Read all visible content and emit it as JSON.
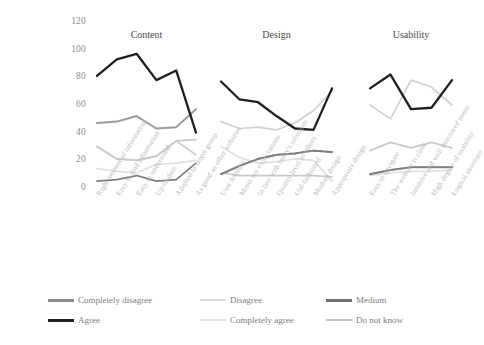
{
  "chart_data": {
    "type": "line",
    "title": "",
    "xlabel": "",
    "ylabel": "",
    "ylim": [
      0,
      120
    ],
    "ytick_values": [
      0,
      20,
      40,
      60,
      80,
      100,
      120
    ],
    "ytick_labels": [
      "0",
      "20",
      "40",
      "60",
      "80",
      "100",
      "120"
    ],
    "grid": false,
    "legend_position": "bottom",
    "panels": [
      {
        "name": "Content",
        "title": "Content",
        "categories": [
          "Right amount of information",
          "Easy to find information",
          "Easy to understand",
          "Up-to-date",
          "Adapted to target group",
          "As good as other websites"
        ],
        "series": [
          {
            "name": "Completely disagree",
            "color": "#7d7d7d",
            "values": [
              5,
              6,
              9,
              5,
              6,
              18
            ]
          },
          {
            "name": "Disagree",
            "color": "#e0e0e0",
            "values": [
              14,
              12,
              11,
              17,
              18,
              20
            ]
          },
          {
            "name": "Medium",
            "color": "#9a9a9a",
            "values": [
              47,
              48,
              52,
              43,
              44,
              57
            ]
          },
          {
            "name": "Agree",
            "color": "#1f1f1f",
            "values": [
              81,
              93,
              97,
              78,
              85,
              40
            ]
          },
          {
            "name": "Completely agree",
            "color": "#d0d0d0",
            "values": [
              30,
              21,
              20,
              23,
              34,
              24
            ]
          },
          {
            "name": "Do not know",
            "color": "#c9c9c9",
            "values": [
              30,
              21,
              20,
              23,
              34,
              35
            ]
          }
        ]
      },
      {
        "name": "Design",
        "title": "Design",
        "categories": [
          "User friendly",
          "Meets my expectations",
          "In line with today's solutions",
          "Quality level as others",
          "Old-fashioned",
          "Modern design",
          "Appropriate design"
        ],
        "series": [
          {
            "name": "Completely disagree",
            "color": "#7d7d7d",
            "values": [
              10,
              16,
              21,
              24,
              25,
              27,
              26
            ]
          },
          {
            "name": "Disagree",
            "color": "#e0e0e0",
            "values": [
              30,
              22,
              18,
              19,
              21,
              20,
              5
            ]
          },
          {
            "name": "Medium",
            "color": "#9a9a9a",
            "values": [
              10,
              16,
              21,
              24,
              25,
              27,
              26
            ]
          },
          {
            "name": "Agree",
            "color": "#1f1f1f",
            "values": [
              77,
              64,
              62,
              52,
              43,
              42,
              72
            ]
          },
          {
            "name": "Completely agree",
            "color": "#d0d0d0",
            "values": [
              48,
              43,
              44,
              42,
              47,
              56,
              70
            ]
          },
          {
            "name": "Do not know",
            "color": "#c9c9c9",
            "values": [
              11,
              9,
              9,
              9,
              9,
              9,
              8
            ]
          }
        ]
      },
      {
        "name": "Usability",
        "title": "Usability",
        "categories": [
          "Easy to navigate",
          "The website is clear",
          "Intuitive and well structured menu",
          "High degree of usability",
          "Logical structure"
        ],
        "series": [
          {
            "name": "Completely disagree",
            "color": "#7d7d7d",
            "values": [
              10,
              13,
              15,
              15,
              15
            ]
          },
          {
            "name": "Disagree",
            "color": "#e0e0e0",
            "values": [
              9,
              11,
              12,
              12,
              13
            ]
          },
          {
            "name": "Medium",
            "color": "#9a9a9a",
            "values": [
              10,
              13,
              15,
              15,
              15
            ]
          },
          {
            "name": "Agree",
            "color": "#1f1f1f",
            "values": [
              72,
              82,
              57,
              58,
              78
            ]
          },
          {
            "name": "Completely agree",
            "color": "#d0d0d0",
            "values": [
              60,
              50,
              78,
              73,
              60
            ]
          },
          {
            "name": "Do not know",
            "color": "#c9c9c9",
            "values": [
              27,
              33,
              29,
              33,
              29
            ]
          }
        ]
      }
    ],
    "legend": [
      {
        "label": "Completely disagree",
        "color": "#8a8a8a",
        "width": 3.2
      },
      {
        "label": "Disagree",
        "color": "#dcdcdc",
        "width": 2.4
      },
      {
        "label": "Medium",
        "color": "#6f6f6f",
        "width": 3.2
      },
      {
        "label": "Agree",
        "color": "#1f1f1f",
        "width": 3.6
      },
      {
        "label": "Completely agree",
        "color": "#e4e4e4",
        "width": 2.2
      },
      {
        "label": "Do not know",
        "color": "#c2c2c2",
        "width": 2.6
      }
    ]
  },
  "layout": {
    "y_top_px": 22,
    "y_bottom_px": 188,
    "panels_px": [
      {
        "x0": 97,
        "x1": 196
      },
      {
        "x0": 221,
        "x1": 332
      },
      {
        "x0": 370,
        "x1": 452
      }
    ],
    "title_y_px": 30,
    "xlabel_top_px": 193
  }
}
